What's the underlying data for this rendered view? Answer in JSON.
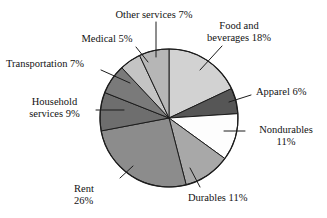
{
  "chart_data": {
    "type": "pie",
    "title": "",
    "subtitle": "",
    "xlabel": "",
    "ylabel": "",
    "legend_position": "none",
    "grid": false,
    "units": "percent",
    "start_angle_deg": 0,
    "direction": "clockwise",
    "categories": [
      "Food and beverages",
      "Apparel",
      "Nondurables",
      "Durables",
      "Rent",
      "Household services",
      "Transportation",
      "Medical",
      "Other services"
    ],
    "values": [
      18,
      6,
      11,
      11,
      26,
      9,
      7,
      5,
      7
    ],
    "slices": [
      {
        "label": "Food and beverages",
        "value": 18,
        "value_text": "18%",
        "color": "#d2d2d2"
      },
      {
        "label": "Apparel",
        "value": 6,
        "value_text": "6%",
        "color": "#565656"
      },
      {
        "label": "Nondurables",
        "value": 11,
        "value_text": "11%",
        "color": "#fdfdfd"
      },
      {
        "label": "Durables",
        "value": 11,
        "value_text": "11%",
        "color": "#a8a8a8"
      },
      {
        "label": "Rent",
        "value": 26,
        "value_text": "26%",
        "color": "#8c8c8c"
      },
      {
        "label": "Household services",
        "value": 9,
        "value_text": "9%",
        "color": "#6e6e6e"
      },
      {
        "label": "Transportation",
        "value": 7,
        "value_text": "7%",
        "color": "#7a7a7a"
      },
      {
        "label": "Medical",
        "value": 5,
        "value_text": "5%",
        "color": "#c4c4c4"
      },
      {
        "label": "Other services",
        "value": 7,
        "value_text": "7%",
        "color": "#b6b6b6"
      }
    ]
  },
  "labels": {
    "other_services": "Other services 7%",
    "food_beverages": "Food and\nbeverages 18%",
    "medical": "Medical 5%",
    "transportation": "Transportation 7%",
    "household_services": "Household\nservices 9%",
    "apparel": "Apparel 6%",
    "nondurables": "Nondurables\n11%",
    "durables": "Durables 11%",
    "rent": "Rent\n26%"
  },
  "style": {
    "outline_color": "#1c1c1c",
    "background": "#ffffff",
    "leader_color": "#1c1c1c"
  }
}
